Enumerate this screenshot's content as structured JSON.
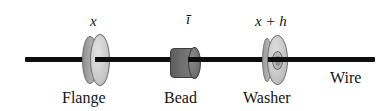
{
  "figure": {
    "background_color": "#ffffff",
    "line_color": "#0d0d0d"
  },
  "wire": {
    "label": "Wire",
    "color": "#0d0d0d"
  },
  "parts": [
    {
      "id": "flange",
      "name_label": "Flange",
      "position_label": "x",
      "shape": "disc",
      "fill_color": "#cfcfcf",
      "edge_color": "#6d6d6d"
    },
    {
      "id": "bead",
      "name_label": "Bead",
      "position_label": "ī",
      "shape": "cylinder",
      "fill_color": "#6e6e6e",
      "edge_color": "#3d3d3d"
    },
    {
      "id": "washer",
      "name_label": "Washer",
      "position_label": "x + h",
      "shape": "annulus",
      "fill_color": "#c9c9c9",
      "edge_color": "#6d6d6d"
    }
  ]
}
